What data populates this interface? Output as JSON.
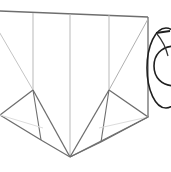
{
  "figure": {
    "background_color": "#ffffff",
    "width": 171,
    "height": 172,
    "stroke_colors": {
      "dark": "#2b2b2b",
      "medium": "#6e6e6e",
      "light": "#b9b9b9",
      "faint": "#d8d8d8"
    },
    "annotations": {
      "top_edge_label": "",
      "apex_label": "",
      "circle_label": ""
    }
  },
  "geometry": {
    "top_edge": {
      "x1": 0,
      "y1": 11,
      "x2": 148,
      "y2": 17
    },
    "right_edge": {
      "x1": 148,
      "y1": 17,
      "x2": 148,
      "y2": 117
    },
    "vertical_ribs": [
      {
        "name": "rib-left",
        "x1": 33,
        "y1": 13,
        "x2": 33,
        "y2": 90
      },
      {
        "name": "rib-center",
        "x1": 70,
        "y1": 14,
        "x2": 70,
        "y2": 157
      },
      {
        "name": "rib-right",
        "x1": 109,
        "y1": 15,
        "x2": 109,
        "y2": 90
      }
    ],
    "diagonals": [
      {
        "name": "diag-upper-left",
        "x1": 0,
        "y1": 33,
        "x2": 33,
        "y2": 90
      },
      {
        "name": "diag-upper-right",
        "x1": 148,
        "y1": 19,
        "x2": 109,
        "y2": 90
      }
    ],
    "wings": {
      "left": {
        "outer": [
          [
            33,
            90
          ],
          [
            0,
            115
          ],
          [
            41,
            140
          ]
        ],
        "inner_fold": [
          [
            33,
            90
          ],
          [
            41,
            140
          ]
        ],
        "faint_fold": [
          [
            0,
            115
          ],
          [
            41,
            127
          ]
        ]
      },
      "right": {
        "outer": [
          [
            109,
            90
          ],
          [
            148,
            117
          ],
          [
            101,
            142
          ]
        ],
        "inner_fold": [
          [
            109,
            90
          ],
          [
            101,
            142
          ]
        ],
        "faint_fold": [
          [
            148,
            117
          ],
          [
            101,
            127
          ]
        ]
      }
    },
    "apex": {
      "x": 70,
      "y": 157
    },
    "apex_rays": [
      {
        "name": "ray-left-outer",
        "x1": 33,
        "y1": 90,
        "x2": 70,
        "y2": 157
      },
      {
        "name": "ray-left-inner",
        "x1": 41,
        "y1": 140,
        "x2": 70,
        "y2": 157
      },
      {
        "name": "ray-right-outer",
        "x1": 109,
        "y1": 90,
        "x2": 70,
        "y2": 157
      },
      {
        "name": "ray-right-inner",
        "x1": 101,
        "y1": 142,
        "x2": 70,
        "y2": 157
      },
      {
        "name": "ray-right-rim",
        "x1": 148,
        "y1": 117,
        "x2": 70,
        "y2": 157
      }
    ],
    "circle_motif": {
      "outer_loop": {
        "cx": 166,
        "cy": 68,
        "rx": 19,
        "ry": 40
      },
      "inner_loop": {
        "cx": 170,
        "cy": 65,
        "rx": 12,
        "ry": 22
      },
      "tick": {
        "x1": 157,
        "y1": 33,
        "x2": 169,
        "y2": 31
      }
    }
  }
}
